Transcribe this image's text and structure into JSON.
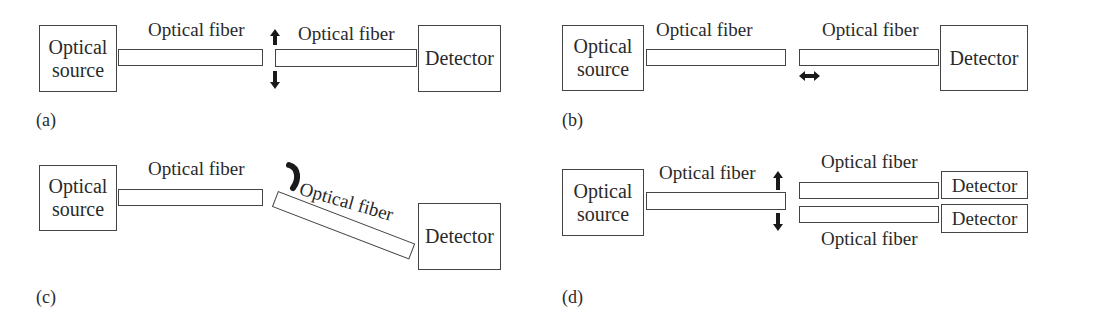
{
  "panels": {
    "a": {
      "label": "(a)",
      "source": "Optical source",
      "source_lines": [
        "Optical",
        "source"
      ],
      "fiber1_label": "Optical fiber",
      "fiber2_label": "Optical fiber",
      "detector": "Detector",
      "motion": "vertical-displacement-arrows"
    },
    "b": {
      "label": "(b)",
      "source_lines": [
        "Optical",
        "source"
      ],
      "fiber1_label": "Optical fiber",
      "fiber2_label": "Optical fiber",
      "detector": "Detector",
      "motion": "horizontal-double-arrow"
    },
    "c": {
      "label": "(c)",
      "source_lines": [
        "Optical",
        "source"
      ],
      "fiber1_label": "Optical fiber",
      "fiber2_label": "Optical fiber",
      "detector": "Detector",
      "motion": "angular-rotation-arrow"
    },
    "d": {
      "label": "(d)",
      "source_lines": [
        "Optical",
        "source"
      ],
      "fiber1_label": "Optical fiber",
      "fiber_upper_label": "Optical fiber",
      "fiber_lower_label": "Optical fiber",
      "detector_upper": "Detector",
      "detector_lower": "Detector",
      "motion": "vertical-displacement-arrows"
    }
  },
  "colors": {
    "line": "#444444",
    "arrow": "#1a1a1a",
    "text": "#2a2a2a"
  }
}
